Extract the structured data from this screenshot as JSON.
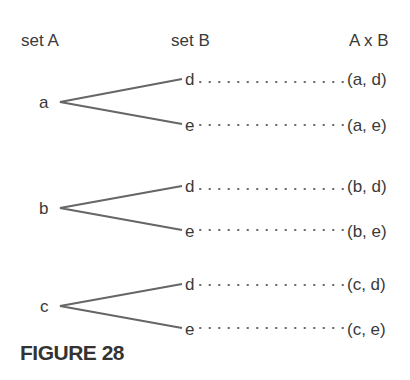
{
  "headers": {
    "set_a": "set A",
    "set_b": "set B",
    "product": "A x B"
  },
  "set_a": [
    "a",
    "b",
    "c"
  ],
  "set_b": [
    "d",
    "e"
  ],
  "rows": [
    {
      "from": "a",
      "to": "d",
      "pair": "(a, d)"
    },
    {
      "from": "a",
      "to": "e",
      "pair": "(a, e)"
    },
    {
      "from": "b",
      "to": "d",
      "pair": "(b, d)"
    },
    {
      "from": "b",
      "to": "e",
      "pair": "(b, e)"
    },
    {
      "from": "c",
      "to": "d",
      "pair": "(c, d)"
    },
    {
      "from": "c",
      "to": "e",
      "pair": "(c, e)"
    }
  ],
  "caption": "FIGURE 28",
  "colors": {
    "line": "#666666",
    "text": "#3a3a3a"
  }
}
